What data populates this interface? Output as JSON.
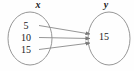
{
  "diagram": {
    "type": "mapping-diagram",
    "title": "",
    "stroke_color": "#808080",
    "text_color": "#1a1a1a",
    "background_color": "#fefefe",
    "domain": {
      "label": "x",
      "values": [
        "5",
        "10",
        "15"
      ]
    },
    "range": {
      "label": "y",
      "values": [
        "15"
      ]
    },
    "mappings": [
      {
        "from": "5",
        "to": "15"
      },
      {
        "from": "10",
        "to": "15"
      },
      {
        "from": "15",
        "to": "15"
      }
    ]
  }
}
